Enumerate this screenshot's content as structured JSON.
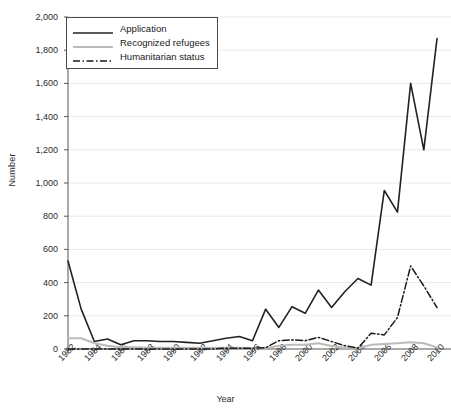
{
  "chart_data": {
    "type": "line",
    "title": "",
    "xlabel": "Year",
    "ylabel": "Number",
    "xlim": [
      1982,
      2010
    ],
    "ylim": [
      0,
      2000
    ],
    "grid": true,
    "legend_position": "top-left",
    "x": [
      1982,
      1983,
      1984,
      1985,
      1986,
      1987,
      1988,
      1989,
      1990,
      1991,
      1992,
      1993,
      1994,
      1995,
      1996,
      1997,
      1998,
      1999,
      2000,
      2001,
      2002,
      2003,
      2004,
      2005,
      2006,
      2007,
      2008,
      2009,
      2010
    ],
    "xtick_labels": [
      "1982",
      "1984",
      "1986",
      "1988",
      "1990",
      "1992",
      "1994",
      "1996",
      "1998",
      "2000",
      "2002",
      "2004",
      "2006",
      "2008",
      "2010"
    ],
    "xtick_values": [
      1982,
      1984,
      1986,
      1988,
      1990,
      1992,
      1994,
      1996,
      1998,
      2000,
      2002,
      2004,
      2006,
      2008,
      2010
    ],
    "ytick_labels": [
      "0",
      "200",
      "400",
      "600",
      "800",
      "1,000",
      "1,200",
      "1,400",
      "1,600",
      "1,800",
      "2,000"
    ],
    "ytick_values": [
      0,
      200,
      400,
      600,
      800,
      1000,
      1200,
      1400,
      1600,
      1800,
      2000
    ],
    "series": [
      {
        "name": "Application",
        "style": "solid",
        "color": "#222222",
        "width": 1.6,
        "values": [
          530,
          240,
          45,
          60,
          25,
          50,
          50,
          45,
          45,
          40,
          35,
          50,
          65,
          75,
          50,
          240,
          130,
          255,
          215,
          355,
          250,
          345,
          425,
          385,
          955,
          825,
          1600,
          1200,
          1870
        ]
      },
      {
        "name": "Recognized refugees",
        "style": "solid",
        "color": "#bbbbbb",
        "width": 2.0,
        "values": [
          65,
          65,
          35,
          20,
          10,
          10,
          8,
          8,
          8,
          8,
          8,
          8,
          8,
          8,
          5,
          5,
          20,
          25,
          25,
          35,
          18,
          8,
          5,
          25,
          30,
          35,
          40,
          35,
          10
        ]
      },
      {
        "name": "Humanitarian status",
        "style": "dashdot",
        "color": "#1a1a1a",
        "width": 1.5,
        "values": [
          0,
          0,
          0,
          0,
          0,
          0,
          0,
          0,
          0,
          0,
          0,
          0,
          5,
          5,
          5,
          8,
          50,
          55,
          50,
          70,
          45,
          20,
          5,
          95,
          85,
          190,
          500,
          380,
          250
        ]
      }
    ]
  },
  "legend": {
    "items": [
      {
        "label": "Application",
        "icon": "solid-line-swatch"
      },
      {
        "label": "Recognized refugees",
        "icon": "light-solid-line-swatch"
      },
      {
        "label": "Humanitarian status",
        "icon": "dash-dot-line-swatch"
      }
    ]
  }
}
